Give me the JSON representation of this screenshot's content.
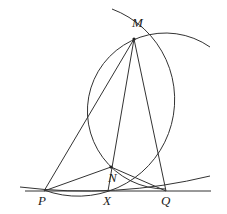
{
  "diagram": {
    "type": "geometry-construction",
    "stroke_color": "#333333",
    "points": {
      "M": {
        "label": "M",
        "x": 134,
        "y": 39
      },
      "N": {
        "label": "N",
        "x": 111,
        "y": 167
      },
      "P": {
        "label": "P",
        "x": 44,
        "y": 191
      },
      "X": {
        "label": "X",
        "x": 108,
        "y": 191
      },
      "Q": {
        "label": "Q",
        "x": 166,
        "y": 191
      }
    },
    "segments": [
      "MP",
      "MN",
      "MX",
      "MQ",
      "NP",
      "NQ",
      "PQ-line"
    ],
    "arcs": [
      "circle-through-M-N-Q",
      "circle-through-M-N-P",
      "circle-tangent-at-line-through-P-Q"
    ]
  }
}
